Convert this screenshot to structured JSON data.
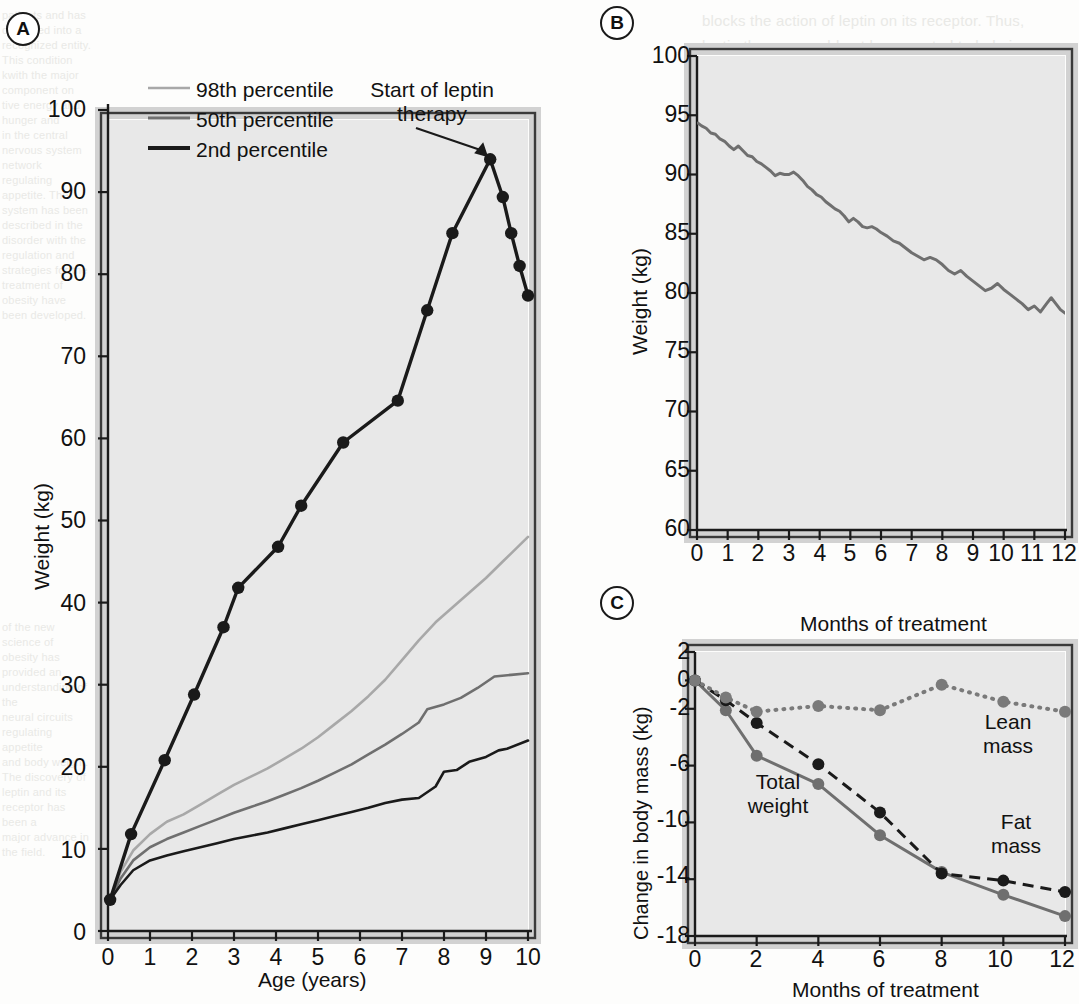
{
  "figure": {
    "background_color": "#fdfdfc",
    "plot_area_color": "#e8e8e8",
    "plot_border_color": "#3a3a3a",
    "colors": {
      "dark": "#1a1a1a",
      "mid_gray": "#6f6f6f",
      "light_gray": "#a8a8a8",
      "marker_gray": "#7a7a7a"
    }
  },
  "bleed_text": {
    "top_right": "blocks the action of leptin on its receptor. Thus,\nleptin therapy would not be expected to help in\nsuch cases and in fact may be detrimental. The\nrelationship between leptin concentrations and\nobesity is complex and most obese individuals\nhave elevated leptin levels, suggesting that they\nare resistant to the actions of leptin. Whether\nleptin administration in such states would be\nuseful remains to be established. A trial of leptin\nin obese subjects showed modest weight loss.",
    "mid_right": "PTIVE MECHANISMS\nTAIN ENERGY BALANCE",
    "left_col": "patients and has collapsed into a\nrecognized entity. This condition\nkwith the major component on\ntive energy and hunger and\nin the central nervous system\nnetwork regulating appetite. The\nsystem has been described in the\ndisorder with the regulation and\nstrategies for the treatment of\nobesity have been developed.",
    "lower_left": "of the new science of obesity has\nprovided an understanding of the\nneural circuits regulating appetite\nand body weight. The discovery of\nleptin and its receptor has been a\nmajor advance in the field."
  },
  "panelA": {
    "tag": "A",
    "x_axis": {
      "label": "Age (years)",
      "ticks": [
        "0",
        "1",
        "2",
        "3",
        "4",
        "5",
        "6",
        "7",
        "8",
        "9",
        "10"
      ],
      "min": 0,
      "max": 10
    },
    "y_axis": {
      "label": "Weight (kg)",
      "ticks": [
        "0",
        "10",
        "20",
        "30",
        "40",
        "50",
        "60",
        "70",
        "80",
        "90",
        "100"
      ],
      "min": 0,
      "max": 100
    },
    "legend": [
      {
        "label": "98th percentile",
        "color": "#a8a8a8"
      },
      {
        "label": "50th percentile",
        "color": "#6f6f6f"
      },
      {
        "label": "2nd percentile",
        "color": "#1a1a1a"
      }
    ],
    "annotation": {
      "text": "Start of leptin\ntherapy",
      "points_to": {
        "x": 9.1,
        "y": 94
      }
    },
    "series": [
      {
        "name": "patient",
        "color": "#1a1a1a",
        "markers": true,
        "points": [
          [
            0.05,
            3.8
          ],
          [
            0.55,
            11.8
          ],
          [
            1.35,
            20.8
          ],
          [
            2.05,
            28.8
          ],
          [
            2.75,
            37.0
          ],
          [
            3.1,
            41.8
          ],
          [
            4.05,
            46.8
          ],
          [
            4.6,
            51.8
          ],
          [
            5.6,
            59.5
          ],
          [
            6.9,
            64.6
          ],
          [
            7.6,
            75.6
          ],
          [
            8.2,
            85.0
          ],
          [
            9.1,
            94.0
          ],
          [
            9.4,
            89.4
          ],
          [
            9.6,
            85.0
          ],
          [
            9.8,
            81.0
          ],
          [
            10.0,
            77.4
          ]
        ]
      },
      {
        "name": "98th percentile",
        "color": "#a8a8a8",
        "markers": false,
        "points": [
          [
            0.05,
            3.8
          ],
          [
            0.3,
            7.2
          ],
          [
            0.6,
            9.8
          ],
          [
            1.0,
            11.8
          ],
          [
            1.4,
            13.3
          ],
          [
            1.8,
            14.2
          ],
          [
            2.2,
            15.4
          ],
          [
            2.6,
            16.6
          ],
          [
            3.0,
            17.8
          ],
          [
            3.4,
            18.8
          ],
          [
            3.8,
            19.8
          ],
          [
            4.2,
            21.0
          ],
          [
            4.6,
            22.2
          ],
          [
            5.0,
            23.6
          ],
          [
            5.4,
            25.2
          ],
          [
            5.8,
            26.8
          ],
          [
            6.2,
            28.6
          ],
          [
            6.6,
            30.6
          ],
          [
            7.0,
            33.0
          ],
          [
            7.4,
            35.4
          ],
          [
            7.8,
            37.6
          ],
          [
            8.2,
            39.4
          ],
          [
            8.6,
            41.2
          ],
          [
            9.0,
            43.0
          ],
          [
            9.4,
            45.0
          ],
          [
            10.0,
            48.0
          ]
        ]
      },
      {
        "name": "50th percentile",
        "color": "#6f6f6f",
        "markers": false,
        "points": [
          [
            0.05,
            3.8
          ],
          [
            0.3,
            6.4
          ],
          [
            0.6,
            8.6
          ],
          [
            1.0,
            10.2
          ],
          [
            1.4,
            11.2
          ],
          [
            1.8,
            12.0
          ],
          [
            2.2,
            12.8
          ],
          [
            2.6,
            13.6
          ],
          [
            3.0,
            14.4
          ],
          [
            3.4,
            15.1
          ],
          [
            3.8,
            15.8
          ],
          [
            4.2,
            16.6
          ],
          [
            4.6,
            17.4
          ],
          [
            5.0,
            18.3
          ],
          [
            5.4,
            19.3
          ],
          [
            5.8,
            20.3
          ],
          [
            6.2,
            21.5
          ],
          [
            6.6,
            22.7
          ],
          [
            7.0,
            24.0
          ],
          [
            7.4,
            25.4
          ],
          [
            7.6,
            27.0
          ],
          [
            8.0,
            27.6
          ],
          [
            8.4,
            28.4
          ],
          [
            8.8,
            29.6
          ],
          [
            9.2,
            31.0
          ],
          [
            9.6,
            31.2
          ],
          [
            10.0,
            31.4
          ]
        ]
      },
      {
        "name": "2nd percentile",
        "color": "#1a1a1a",
        "markers": false,
        "points": [
          [
            0.05,
            3.8
          ],
          [
            0.3,
            5.6
          ],
          [
            0.6,
            7.4
          ],
          [
            1.0,
            8.6
          ],
          [
            1.4,
            9.2
          ],
          [
            1.8,
            9.7
          ],
          [
            2.2,
            10.2
          ],
          [
            2.6,
            10.7
          ],
          [
            3.0,
            11.2
          ],
          [
            3.4,
            11.6
          ],
          [
            3.8,
            12.0
          ],
          [
            4.2,
            12.5
          ],
          [
            4.6,
            13.0
          ],
          [
            5.0,
            13.5
          ],
          [
            5.4,
            14.0
          ],
          [
            5.8,
            14.5
          ],
          [
            6.2,
            15.0
          ],
          [
            6.6,
            15.6
          ],
          [
            7.0,
            16.0
          ],
          [
            7.4,
            16.2
          ],
          [
            7.8,
            17.6
          ],
          [
            8.0,
            19.4
          ],
          [
            8.3,
            19.6
          ],
          [
            8.6,
            20.6
          ],
          [
            9.0,
            21.2
          ],
          [
            9.3,
            22.0
          ],
          [
            9.5,
            22.2
          ],
          [
            10.0,
            23.2
          ]
        ]
      }
    ]
  },
  "panelB": {
    "tag": "B",
    "x_axis": {
      "label": "Months of treatment",
      "ticks": [
        "0",
        "1",
        "2",
        "3",
        "4",
        "5",
        "6",
        "7",
        "8",
        "9",
        "10",
        "11",
        "12"
      ],
      "min": 0,
      "max": 12
    },
    "y_axis": {
      "label": "Weight (kg)",
      "ticks": [
        "60",
        "65",
        "70",
        "75",
        "80",
        "85",
        "90",
        "95",
        "100"
      ],
      "min": 60,
      "max": 100
    },
    "series": [
      {
        "name": "weight",
        "color": "#6f6f6f",
        "points": [
          [
            0.0,
            94.4
          ],
          [
            0.15,
            94.1
          ],
          [
            0.3,
            93.9
          ],
          [
            0.45,
            93.5
          ],
          [
            0.6,
            93.4
          ],
          [
            0.75,
            93.0
          ],
          [
            0.9,
            92.8
          ],
          [
            1.05,
            92.4
          ],
          [
            1.2,
            92.1
          ],
          [
            1.35,
            92.4
          ],
          [
            1.5,
            92.0
          ],
          [
            1.65,
            91.6
          ],
          [
            1.8,
            91.5
          ],
          [
            1.95,
            91.1
          ],
          [
            2.1,
            90.9
          ],
          [
            2.25,
            90.6
          ],
          [
            2.4,
            90.3
          ],
          [
            2.55,
            89.9
          ],
          [
            2.7,
            90.1
          ],
          [
            2.85,
            90.0
          ],
          [
            3.0,
            90.0
          ],
          [
            3.15,
            90.2
          ],
          [
            3.3,
            89.9
          ],
          [
            3.45,
            89.5
          ],
          [
            3.6,
            89.0
          ],
          [
            3.75,
            88.7
          ],
          [
            3.9,
            88.3
          ],
          [
            4.05,
            88.1
          ],
          [
            4.2,
            87.7
          ],
          [
            4.35,
            87.4
          ],
          [
            4.5,
            87.1
          ],
          [
            4.65,
            86.9
          ],
          [
            4.8,
            86.5
          ],
          [
            4.95,
            86.0
          ],
          [
            5.1,
            86.3
          ],
          [
            5.25,
            86.0
          ],
          [
            5.4,
            85.6
          ],
          [
            5.55,
            85.5
          ],
          [
            5.7,
            85.6
          ],
          [
            5.85,
            85.4
          ],
          [
            6.0,
            85.1
          ],
          [
            6.2,
            84.8
          ],
          [
            6.4,
            84.4
          ],
          [
            6.6,
            84.2
          ],
          [
            6.8,
            83.8
          ],
          [
            7.0,
            83.4
          ],
          [
            7.2,
            83.1
          ],
          [
            7.4,
            82.8
          ],
          [
            7.6,
            83.0
          ],
          [
            7.8,
            82.8
          ],
          [
            8.0,
            82.4
          ],
          [
            8.2,
            81.9
          ],
          [
            8.4,
            81.6
          ],
          [
            8.6,
            81.9
          ],
          [
            8.8,
            81.4
          ],
          [
            9.0,
            81.0
          ],
          [
            9.2,
            80.6
          ],
          [
            9.4,
            80.2
          ],
          [
            9.6,
            80.4
          ],
          [
            9.8,
            80.8
          ],
          [
            10.0,
            80.3
          ],
          [
            10.2,
            79.9
          ],
          [
            10.4,
            79.5
          ],
          [
            10.6,
            79.1
          ],
          [
            10.8,
            78.6
          ],
          [
            11.0,
            78.9
          ],
          [
            11.2,
            78.4
          ],
          [
            11.4,
            79.1
          ],
          [
            11.55,
            79.6
          ],
          [
            11.7,
            79.1
          ],
          [
            11.85,
            78.6
          ],
          [
            12.0,
            78.3
          ],
          [
            12.15,
            78.2
          ],
          [
            12.3,
            77.9
          ],
          [
            12.5,
            78.0
          ],
          [
            12.7,
            77.6
          ],
          [
            12.9,
            77.5
          ],
          [
            13.0,
            77.5
          ]
        ]
      }
    ]
  },
  "panelC": {
    "tag": "C",
    "x_axis": {
      "label": "Months of treatment",
      "ticks": [
        "0",
        "2",
        "4",
        "6",
        "8",
        "10",
        "12"
      ],
      "min": 0,
      "max": 12
    },
    "y_axis": {
      "label": "Change in body mass (kg)",
      "ticks": [
        "-18",
        "-14",
        "-10",
        "-6",
        "-2",
        "0",
        "2"
      ],
      "min": -18,
      "max": 2
    },
    "series": [
      {
        "name": "Total weight",
        "label": "Total\nweight",
        "color": "#6f6f6f",
        "style": "solid",
        "points": [
          [
            0,
            0
          ],
          [
            1,
            -2.1
          ],
          [
            2,
            -5.3
          ],
          [
            4,
            -7.3
          ],
          [
            6,
            -10.9
          ],
          [
            8,
            -13.5
          ],
          [
            10,
            -15.1
          ],
          [
            12,
            -16.6
          ]
        ]
      },
      {
        "name": "Fat mass",
        "label": "Fat\nmass",
        "color": "#1a1a1a",
        "style": "dashed",
        "points": [
          [
            0,
            0
          ],
          [
            1,
            -1.4
          ],
          [
            2,
            -3.0
          ],
          [
            4,
            -5.9
          ],
          [
            6,
            -9.3
          ],
          [
            8,
            -13.6
          ],
          [
            10,
            -14.1
          ],
          [
            12,
            -14.9
          ]
        ]
      },
      {
        "name": "Lean mass",
        "label": "Lean\nmass",
        "color": "#7a7a7a",
        "style": "dotted",
        "points": [
          [
            0,
            0
          ],
          [
            1,
            -1.2
          ],
          [
            2,
            -2.2
          ],
          [
            4,
            -1.8
          ],
          [
            6,
            -2.1
          ],
          [
            8,
            -0.3
          ],
          [
            10,
            -1.5
          ],
          [
            12,
            -2.2
          ]
        ]
      }
    ]
  }
}
